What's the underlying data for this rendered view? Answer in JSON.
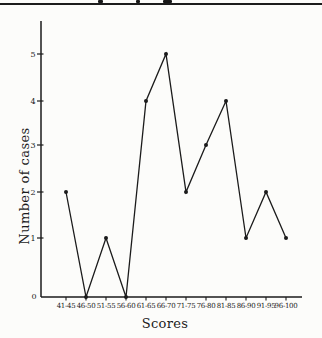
{
  "page": {
    "background": "#fcfcfa",
    "ink_color": "#1b1b1b",
    "top_rule": "full-width horizontal divider under cropped header text"
  },
  "chart_data": {
    "type": "line",
    "title": "",
    "categories": [
      "41-45",
      "46-50",
      "51-55",
      "56-60",
      "61-65",
      "66-70",
      "71-75",
      "76-80",
      "81-85",
      "86-90",
      "91-95",
      "96-100"
    ],
    "values": [
      2,
      0,
      1,
      0,
      4,
      5,
      2,
      3,
      4,
      1,
      2,
      1
    ],
    "xlabel": "Scores",
    "ylabel": "Number of cases",
    "ylim": [
      0,
      5
    ],
    "yticks": [
      0,
      1,
      2,
      3,
      4,
      5
    ],
    "grid": false,
    "legend": false,
    "marker": "filled-circle",
    "line_color": "#1b1b1b"
  }
}
